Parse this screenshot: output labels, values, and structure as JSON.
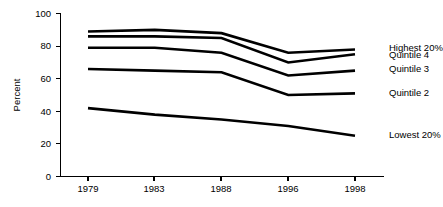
{
  "chart_data": {
    "type": "line",
    "title": "",
    "xlabel": "",
    "ylabel": "Percent",
    "categories": [
      "1979",
      "1983",
      "1988",
      "1996",
      "1998"
    ],
    "x_tick_labels": [
      "1979",
      "1983",
      "1988",
      "1996",
      "1998"
    ],
    "y_tick_labels": [
      "0",
      "20",
      "40",
      "60",
      "80",
      "100"
    ],
    "y_ticks": [
      0,
      20,
      40,
      60,
      80,
      100
    ],
    "ylim": [
      0,
      100
    ],
    "grid": false,
    "legend_position": "right-inline-labels",
    "series": [
      {
        "name": "Highest 20%",
        "label": "Highest 20%",
        "values": [
          89,
          90,
          88,
          76,
          78
        ]
      },
      {
        "name": "Quintile 4",
        "label": "Quintile 4",
        "values": [
          86,
          86,
          85,
          70,
          75
        ]
      },
      {
        "name": "Quintile 3",
        "label": "Quintile 3",
        "values": [
          79,
          79,
          76,
          62,
          65
        ]
      },
      {
        "name": "Quintile 2",
        "label": "Quintile 2",
        "values": [
          66,
          65,
          64,
          50,
          51
        ]
      },
      {
        "name": "Lowest 20%",
        "label": "Lowest 20%",
        "values": [
          42,
          38,
          35,
          31,
          25
        ]
      }
    ],
    "series_label_y": [
      78.5,
      74.5,
      65.5,
      51,
      25
    ],
    "colors": {
      "line": "#000000",
      "axis": "#000000",
      "background": "#ffffff"
    }
  }
}
